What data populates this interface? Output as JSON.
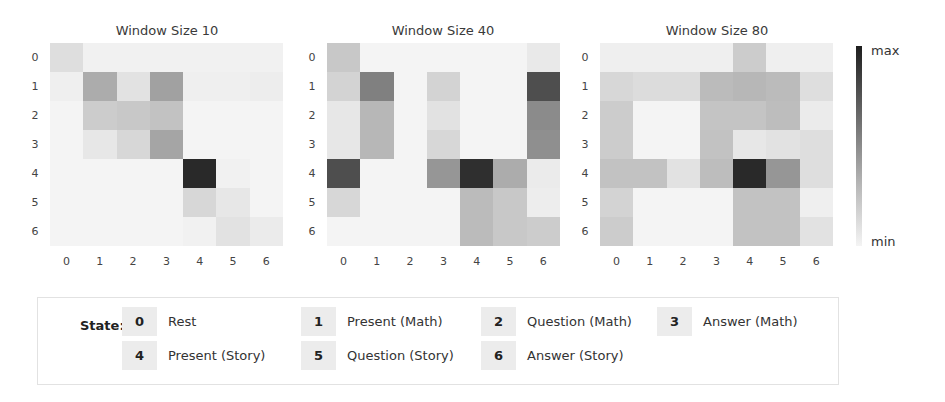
{
  "chart_data": [
    {
      "type": "heatmap",
      "title": "Window Size 10",
      "x_ticks": [
        "0",
        "1",
        "2",
        "3",
        "4",
        "5",
        "6"
      ],
      "y_ticks": [
        "0",
        "1",
        "2",
        "3",
        "4",
        "5",
        "6"
      ],
      "xlabel": "",
      "ylabel": "",
      "value_range": [
        "min",
        "max"
      ],
      "values": [
        [
          0.12,
          0.03,
          0.03,
          0.03,
          0.03,
          0.03,
          0.03
        ],
        [
          0.04,
          0.35,
          0.1,
          0.4,
          0.04,
          0.04,
          0.05
        ],
        [
          0.02,
          0.2,
          0.22,
          0.25,
          0.02,
          0.02,
          0.02
        ],
        [
          0.02,
          0.08,
          0.15,
          0.38,
          0.02,
          0.02,
          0.02
        ],
        [
          0.02,
          0.02,
          0.02,
          0.02,
          0.95,
          0.03,
          0.02
        ],
        [
          0.02,
          0.02,
          0.02,
          0.02,
          0.15,
          0.08,
          0.02
        ],
        [
          0.02,
          0.02,
          0.02,
          0.02,
          0.03,
          0.1,
          0.06
        ]
      ]
    },
    {
      "type": "heatmap",
      "title": "Window Size 40",
      "x_ticks": [
        "0",
        "1",
        "2",
        "3",
        "4",
        "5",
        "6"
      ],
      "y_ticks": [
        "0",
        "1",
        "2",
        "3",
        "4",
        "5",
        "6"
      ],
      "xlabel": "",
      "ylabel": "",
      "value_range": [
        "min",
        "max"
      ],
      "values": [
        [
          0.22,
          0.02,
          0.02,
          0.02,
          0.02,
          0.02,
          0.07
        ],
        [
          0.17,
          0.55,
          0.02,
          0.17,
          0.02,
          0.02,
          0.78
        ],
        [
          0.08,
          0.3,
          0.02,
          0.1,
          0.02,
          0.02,
          0.5
        ],
        [
          0.08,
          0.3,
          0.02,
          0.15,
          0.02,
          0.02,
          0.48
        ],
        [
          0.78,
          0.02,
          0.02,
          0.45,
          0.92,
          0.35,
          0.06
        ],
        [
          0.15,
          0.02,
          0.02,
          0.02,
          0.28,
          0.22,
          0.05
        ],
        [
          0.02,
          0.02,
          0.02,
          0.02,
          0.28,
          0.22,
          0.2
        ]
      ]
    },
    {
      "type": "heatmap",
      "title": "Window Size 80",
      "x_ticks": [
        "0",
        "1",
        "2",
        "3",
        "4",
        "5",
        "6"
      ],
      "y_ticks": [
        "0",
        "1",
        "2",
        "3",
        "4",
        "5",
        "6"
      ],
      "xlabel": "",
      "ylabel": "",
      "value_range": [
        "min",
        "max"
      ],
      "values": [
        [
          0.04,
          0.04,
          0.04,
          0.04,
          0.2,
          0.04,
          0.04
        ],
        [
          0.15,
          0.13,
          0.13,
          0.28,
          0.3,
          0.28,
          0.12
        ],
        [
          0.2,
          0.02,
          0.02,
          0.24,
          0.24,
          0.27,
          0.06
        ],
        [
          0.2,
          0.02,
          0.02,
          0.25,
          0.08,
          0.1,
          0.12
        ],
        [
          0.25,
          0.25,
          0.1,
          0.27,
          0.95,
          0.45,
          0.12
        ],
        [
          0.17,
          0.02,
          0.02,
          0.02,
          0.25,
          0.25,
          0.04
        ],
        [
          0.2,
          0.02,
          0.02,
          0.02,
          0.25,
          0.25,
          0.1
        ]
      ]
    }
  ],
  "panels": [
    {
      "title": "Window Size 10"
    },
    {
      "title": "Window Size 40"
    },
    {
      "title": "Window Size 80"
    }
  ],
  "ticks": [
    "0",
    "1",
    "2",
    "3",
    "4",
    "5",
    "6"
  ],
  "colorbar": {
    "max_label": "max",
    "min_label": "min",
    "colormap": "Greys"
  },
  "legend": {
    "title": "State:",
    "items": [
      {
        "id": "0",
        "label": "Rest"
      },
      {
        "id": "1",
        "label": "Present (Math)"
      },
      {
        "id": "2",
        "label": "Question (Math)"
      },
      {
        "id": "3",
        "label": "Answer (Math)"
      },
      {
        "id": "4",
        "label": "Present (Story)"
      },
      {
        "id": "5",
        "label": "Question (Story)"
      },
      {
        "id": "6",
        "label": "Answer (Story)"
      }
    ]
  }
}
